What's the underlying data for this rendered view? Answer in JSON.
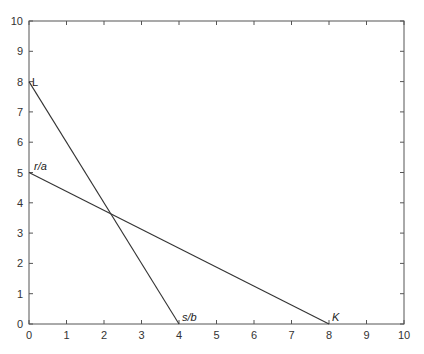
{
  "chart_data": {
    "type": "line",
    "title": "",
    "xlabel": "",
    "ylabel": "",
    "xlim": [
      0,
      10
    ],
    "ylim": [
      0,
      10
    ],
    "x_ticks": [
      0,
      1,
      2,
      3,
      4,
      5,
      6,
      7,
      8,
      9,
      10
    ],
    "y_ticks": [
      0,
      1,
      2,
      3,
      4,
      5,
      6,
      7,
      8,
      9,
      10
    ],
    "grid": false,
    "legend": null,
    "series": [
      {
        "name": "L to s/b",
        "x": [
          0,
          4
        ],
        "y": [
          8,
          0
        ],
        "start_label": "L",
        "end_label": "s/b"
      },
      {
        "name": "r/a to K",
        "x": [
          0,
          8
        ],
        "y": [
          5,
          0
        ],
        "start_label": "r/a",
        "end_label": "K"
      }
    ],
    "annotations": [
      {
        "text": "L",
        "x": 0,
        "y": 8
      },
      {
        "text": "r/a",
        "x": 0,
        "y": 5
      },
      {
        "text": "s/b",
        "x": 4,
        "y": 0
      },
      {
        "text": "K",
        "x": 8,
        "y": 0
      }
    ],
    "intersection": {
      "x": 2.2,
      "y": 3.6
    }
  }
}
